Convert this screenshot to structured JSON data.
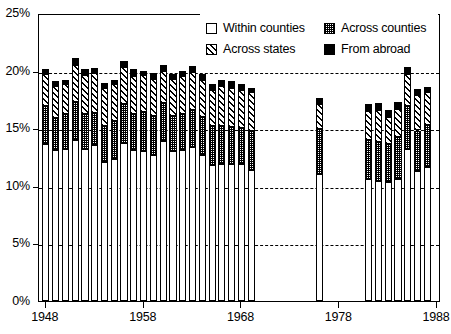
{
  "chart_data": {
    "type": "bar",
    "subtype": "stacked-bar",
    "title": "",
    "xlabel": "",
    "ylabel": "",
    "ylim": [
      0,
      25
    ],
    "yunit": "%",
    "grid": true,
    "gridlines": [
      5,
      10,
      15,
      20
    ],
    "y_ticks": [
      0,
      5,
      10,
      15,
      20,
      25
    ],
    "y_tick_labels": [
      "0%",
      "5%",
      "10%",
      "15%",
      "20%",
      "25%"
    ],
    "x_ticks": [
      1948,
      1958,
      1968,
      1978,
      1988
    ],
    "x_tick_labels": [
      "1948",
      "1958",
      "1968",
      "1978",
      "1988"
    ],
    "xlim": [
      1947.3,
      1988.4
    ],
    "legend_position": "top-right",
    "series": [
      {
        "name": "Within counties",
        "swatch": "white-box",
        "values": [
          13.6,
          13.1,
          13.2,
          14.0,
          13.2,
          13.5,
          12.1,
          12.3,
          13.7,
          13.1,
          13.0,
          12.7,
          13.9,
          13.0,
          13.1,
          13.4,
          12.7,
          11.8,
          11.9,
          11.9,
          11.9,
          11.4,
          null,
          null,
          null,
          null,
          null,
          null,
          11.0,
          null,
          null,
          null,
          null,
          10.6,
          10.4,
          10.3,
          10.6,
          13.2,
          11.3,
          11.6
        ]
      },
      {
        "name": "Across counties",
        "swatch": "dotted-gray-box",
        "values": [
          3.3,
          2.8,
          3.0,
          3.3,
          3.0,
          2.8,
          3.1,
          3.3,
          3.4,
          3.1,
          3.4,
          3.4,
          3.3,
          3.1,
          3.1,
          3.2,
          3.3,
          3.4,
          3.3,
          3.2,
          3.1,
          3.4,
          null,
          null,
          null,
          null,
          null,
          null,
          3.9,
          null,
          null,
          null,
          null,
          3.4,
          3.4,
          3.3,
          3.6,
          3.7,
          3.5,
          3.7
        ]
      },
      {
        "name": "Across states",
        "swatch": "hatched-box",
        "values": [
          2.8,
          2.8,
          2.6,
          3.2,
          3.4,
          3.5,
          3.3,
          3.2,
          3.2,
          3.3,
          3.2,
          3.2,
          2.8,
          3.2,
          3.3,
          3.3,
          3.2,
          3.1,
          3.5,
          3.4,
          3.3,
          3.3,
          null,
          null,
          null,
          null,
          null,
          null,
          2.2,
          null,
          null,
          null,
          null,
          2.5,
          2.8,
          2.4,
          2.5,
          2.8,
          3.1,
          2.8
        ]
      },
      {
        "name": "From abroad",
        "swatch": "solid-black-box",
        "values": [
          0.4,
          0.4,
          0.4,
          0.6,
          0.5,
          0.4,
          0.4,
          0.4,
          0.5,
          0.6,
          0.4,
          0.5,
          0.5,
          0.4,
          0.5,
          0.5,
          0.5,
          0.5,
          0.5,
          0.6,
          0.5,
          0.4,
          null,
          null,
          null,
          null,
          null,
          null,
          0.5,
          null,
          null,
          null,
          null,
          0.6,
          0.6,
          0.6,
          0.6,
          0.6,
          0.5,
          0.5
        ]
      }
    ],
    "categories": [
      1948,
      1949,
      1950,
      1951,
      1952,
      1953,
      1954,
      1955,
      1956,
      1957,
      1958,
      1959,
      1960,
      1961,
      1962,
      1963,
      1964,
      1965,
      1966,
      1967,
      1968,
      1969,
      1970,
      1971,
      1972,
      1973,
      1974,
      1975,
      1976,
      1977,
      1978,
      1979,
      1980,
      1981,
      1982,
      1983,
      1984,
      1985,
      1986,
      1987
    ],
    "totals": [
      20.1,
      19.1,
      19.2,
      21.1,
      20.1,
      20.2,
      18.9,
      19.2,
      20.8,
      20.1,
      20.0,
      19.8,
      20.5,
      19.7,
      20.0,
      20.4,
      19.7,
      18.8,
      19.2,
      19.1,
      18.8,
      18.5,
      null,
      null,
      null,
      null,
      null,
      null,
      17.6,
      null,
      null,
      null,
      null,
      17.1,
      17.2,
      16.6,
      17.3,
      20.3,
      18.4,
      18.6
    ]
  },
  "legend": {
    "entries": [
      {
        "label": "Within counties",
        "swatch": "within-counties-swatch"
      },
      {
        "label": "Across counties",
        "swatch": "across-counties-swatch"
      },
      {
        "label": "Across states",
        "swatch": "across-states-swatch"
      },
      {
        "label": "From abroad",
        "swatch": "from-abroad-swatch"
      }
    ]
  },
  "colors": {
    "axis": "#000000",
    "grid": "#000000",
    "background": "#ffffff",
    "within_counties": "#ffffff",
    "across_counties": "#9a9a9a",
    "across_states": "#ffffff",
    "from_abroad": "#000000"
  }
}
